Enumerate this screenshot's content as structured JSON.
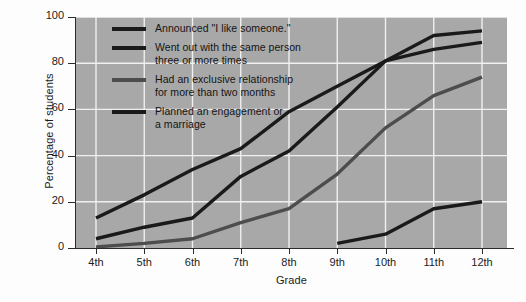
{
  "chart_data": {
    "type": "line",
    "title": "",
    "xlabel": "Grade",
    "ylabel": "Percentage of students",
    "categories": [
      "4th",
      "5th",
      "6th",
      "7th",
      "8th",
      "9th",
      "10th",
      "11th",
      "12th"
    ],
    "ylim": [
      0,
      100
    ],
    "yticks": [
      0,
      20,
      40,
      60,
      80,
      100
    ],
    "grid": true,
    "legend_position": "upper-left-inside",
    "series": [
      {
        "name": "Announced \"I like someone.\"",
        "color": "#1a1a1a",
        "values": [
          13,
          23,
          34,
          43,
          59,
          70,
          81,
          86,
          89
        ]
      },
      {
        "name": "Went out with the same person\nthree or more times",
        "color": "#1a1a1a",
        "values": [
          4,
          9,
          13,
          31,
          42,
          61,
          81,
          92,
          94
        ]
      },
      {
        "name": "Had an exclusive relationship\nfor more than two months",
        "color": "#4d4d4d",
        "values": [
          0.5,
          2,
          4,
          11,
          17,
          32,
          52,
          66,
          74
        ]
      },
      {
        "name": "Planned an engagement or\na marriage",
        "color": "#1a1a1a",
        "values": [
          null,
          null,
          null,
          null,
          null,
          2,
          6,
          17,
          20
        ]
      }
    ]
  },
  "axis": {
    "ytick_labels": [
      "0",
      "20",
      "40",
      "60",
      "80",
      "100"
    ],
    "xtick_labels": [
      "4th",
      "5th",
      "6th",
      "7th",
      "8th",
      "9th",
      "10th",
      "11th",
      "12th"
    ],
    "xlabel": "Grade",
    "ylabel": "Percentage of students"
  },
  "legend": {
    "items": [
      {
        "label": "Announced \"I like someone.\"",
        "swatch": "dark"
      },
      {
        "label": "Went out with the same person\nthree or more times",
        "swatch": "dark"
      },
      {
        "label": "Had an exclusive relationship\nfor more than two months",
        "swatch": "light"
      },
      {
        "label": "Planned an engagement or\na marriage",
        "swatch": "dark"
      }
    ]
  },
  "style": {
    "plot_background": "#a8a8a8",
    "grid_color": "#f0f0f0",
    "axis_color": "#2b2b2b",
    "page_background": "#fdfdfd"
  }
}
